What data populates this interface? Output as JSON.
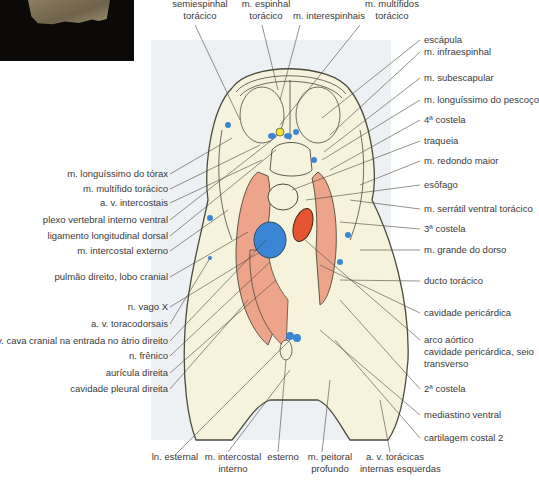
{
  "figure": {
    "colors": {
      "tissue": "#f6f3dc",
      "lung": "#eea48a",
      "vein_blue": "#3a86d4",
      "artery_red": "#e4542e",
      "nerve_yellow": "#f4e23a",
      "outline": "#4a4a3e",
      "panel_bg": "#eef1f4"
    }
  },
  "labels_top": [
    {
      "text": "m.\nsemiespinhal\ntorácico",
      "line1": "semiespinhal",
      "line2": "torácico"
    },
    {
      "line1": "m. espinhal",
      "line2": "torácico"
    },
    {
      "line1": "m. interespinhais",
      "line2": ""
    },
    {
      "line1": "m. multífidos",
      "line2": "torácico"
    }
  ],
  "labels_right": [
    "escápula",
    "m. infraespinhal",
    "m. subescapular",
    "m. longuíssimo do pescoço",
    "4ª costela",
    "traqueia",
    "m. redondo maior",
    "esôfago",
    "m. serrátil ventral torácico",
    "3ª costela",
    "m. grande do dorso",
    "ducto torácico",
    "cavidade pericárdica",
    "arco aórtico",
    "cavidade pericárdica, seio",
    "transverso",
    "2ª costela",
    "mediastino ventral",
    "cartilagem costal 2"
  ],
  "labels_left": [
    "m. longuíssimo do tórax",
    "m. multífido torácico",
    "a. v. intercostais",
    "plexo vertebral interno ventral",
    "ligamento longitudinal dorsal",
    "m. intercostal externo",
    "pulmão direito, lobo cranial",
    "n. vago X",
    "a. v. toracodorsais",
    "v. cava cranial na entrada no átrio direito",
    "n. frênico",
    "aurícula direita",
    "cavidade pleural direita"
  ],
  "labels_bottom": [
    {
      "line1": "ln. esternal",
      "line2": ""
    },
    {
      "line1": "m. intercostal",
      "line2": "interno"
    },
    {
      "line1": "esterno",
      "line2": ""
    },
    {
      "line1": "m. peitoral",
      "line2": "profundo"
    },
    {
      "line1": "a. v. torácicas",
      "line2": "internas esquerdas"
    }
  ]
}
